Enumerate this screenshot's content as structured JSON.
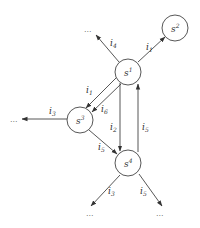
{
  "diagram": {
    "type": "state-transition-graph",
    "nodes": [
      {
        "id": "s1",
        "base": "s",
        "sup": "1",
        "cx": 128,
        "cy": 72
      },
      {
        "id": "s2",
        "base": "s",
        "sup": "2",
        "cx": 175,
        "cy": 28
      },
      {
        "id": "s3",
        "base": "s",
        "sup": "3",
        "cx": 80,
        "cy": 120
      },
      {
        "id": "s4",
        "base": "s",
        "sup": "4",
        "cx": 128,
        "cy": 163
      }
    ],
    "edges": [
      {
        "from": "s1",
        "to": "s2",
        "label_base": "i",
        "label_sub": "1"
      },
      {
        "from": "s1",
        "to": "...",
        "label_base": "i",
        "label_sub": "4"
      },
      {
        "from": "s1",
        "to": "s3",
        "label_base": "i",
        "label_sub": "1"
      },
      {
        "from": "s1",
        "to": "s3",
        "label_base": "i",
        "label_sub": "6"
      },
      {
        "from": "s1",
        "to": "s4",
        "label_base": "i",
        "label_sub": "2"
      },
      {
        "from": "s4",
        "to": "s1",
        "label_base": "i",
        "label_sub": "5"
      },
      {
        "from": "s3",
        "to": "...",
        "label_base": "i",
        "label_sub": "3"
      },
      {
        "from": "s3",
        "to": "s4",
        "label_base": "i",
        "label_sub": "5"
      },
      {
        "from": "s4",
        "to": "...",
        "label_base": "i",
        "label_sub": "3"
      },
      {
        "from": "s4",
        "to": "...",
        "label_base": "i",
        "label_sub": "5"
      }
    ],
    "ellipsis": "..."
  }
}
